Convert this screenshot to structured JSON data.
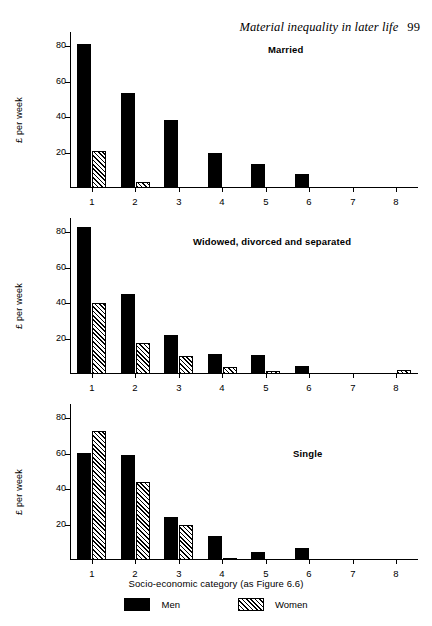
{
  "running_head": {
    "title": "Material inequality in later life",
    "page_number": "99"
  },
  "axes": {
    "ylabel": "£ per week",
    "xlabel": "Socio-economic category (as Figure 6.6)",
    "yticks": [
      "20",
      "40",
      "60",
      "80"
    ],
    "xticks": [
      "1",
      "2",
      "3",
      "4",
      "5",
      "6",
      "7",
      "8"
    ]
  },
  "legend": {
    "items": [
      {
        "label": "Men",
        "swatch": "solid-black-swatch"
      },
      {
        "label": "Women",
        "swatch": "diagonal-hatch-swatch"
      }
    ]
  },
  "panels": [
    {
      "id": "married",
      "title": "Married"
    },
    {
      "id": "widowed",
      "title": "Widowed, divorced and separated"
    },
    {
      "id": "single",
      "title": "Single"
    }
  ],
  "chart_data": [
    {
      "type": "bar",
      "title": "Married",
      "xlabel": "Socio-economic category (as Figure 6.6)",
      "ylabel": "£ per week",
      "categories": [
        "1",
        "2",
        "3",
        "4",
        "5",
        "6",
        "7",
        "8"
      ],
      "ylim": [
        0,
        88
      ],
      "yticks": [
        20,
        40,
        60,
        80
      ],
      "grid": false,
      "legend": "bottom",
      "series": [
        {
          "name": "Men",
          "values": [
            81,
            53.5,
            38.5,
            20,
            13.5,
            8,
            0,
            0
          ]
        },
        {
          "name": "Women",
          "values": [
            21,
            3.5,
            0,
            0,
            0,
            0,
            0,
            0
          ]
        }
      ]
    },
    {
      "type": "bar",
      "title": "Widowed, divorced and separated",
      "xlabel": "Socio-economic category (as Figure 6.6)",
      "ylabel": "£ per week",
      "categories": [
        "1",
        "2",
        "3",
        "4",
        "5",
        "6",
        "7",
        "8"
      ],
      "ylim": [
        0,
        88
      ],
      "yticks": [
        20,
        40,
        60,
        80
      ],
      "grid": false,
      "legend": "bottom",
      "series": [
        {
          "name": "Men",
          "values": [
            83,
            45,
            22,
            11.5,
            11,
            4.5,
            0,
            0
          ]
        },
        {
          "name": "Women",
          "values": [
            40,
            17.5,
            10,
            4,
            1.5,
            0,
            0,
            2
          ]
        }
      ]
    },
    {
      "type": "bar",
      "title": "Single",
      "xlabel": "Socio-economic category (as Figure 6.6)",
      "ylabel": "£ per week",
      "categories": [
        "1",
        "2",
        "3",
        "4",
        "5",
        "6",
        "7",
        "8"
      ],
      "ylim": [
        0,
        88
      ],
      "yticks": [
        20,
        40,
        60,
        80
      ],
      "grid": false,
      "legend": "bottom",
      "series": [
        {
          "name": "Men",
          "values": [
            60.5,
            59,
            24,
            13.5,
            4.5,
            7,
            0,
            0
          ]
        },
        {
          "name": "Women",
          "values": [
            73,
            44,
            20,
            1,
            0,
            0,
            0,
            0
          ]
        }
      ]
    }
  ]
}
